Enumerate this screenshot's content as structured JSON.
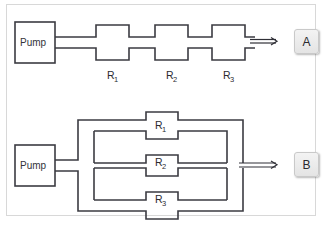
{
  "figure": {
    "title": "",
    "background_color": "#ffffff",
    "frame_color": "#d8d8d8",
    "line_color": "#3b3b42"
  },
  "diagram_a": {
    "id_label": "A",
    "pump_label": "Pump",
    "arrangement": "series",
    "resistors": [
      {
        "label": "R",
        "subscript": "1"
      },
      {
        "label": "R",
        "subscript": "2"
      },
      {
        "label": "R",
        "subscript": "3"
      }
    ],
    "flow_arrow": "flow-arrow-right"
  },
  "diagram_b": {
    "id_label": "B",
    "pump_label": "Pump",
    "arrangement": "parallel",
    "resistors": [
      {
        "label": "R",
        "subscript": "1"
      },
      {
        "label": "R",
        "subscript": "2"
      },
      {
        "label": "R",
        "subscript": "3"
      }
    ],
    "flow_arrow": "flow-arrow-right"
  }
}
